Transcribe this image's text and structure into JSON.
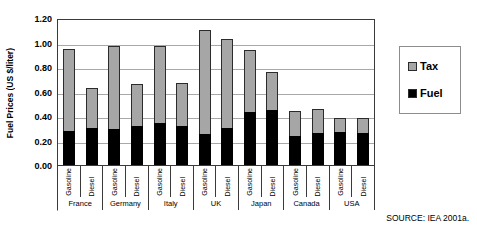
{
  "chart_data": {
    "type": "bar",
    "subtype": "stacked-vertical",
    "title": "",
    "xlabel": "",
    "ylabel": "Fuel Prices (US $/liter)",
    "ylim": [
      0.0,
      1.2
    ],
    "ytick_labels": [
      "1.20",
      "1.00",
      "0.80",
      "0.60",
      "0.40",
      "0.20",
      "0.00"
    ],
    "ytick_values": [
      1.2,
      1.0,
      0.8,
      0.6,
      0.4,
      0.2,
      0.0
    ],
    "grid": true,
    "grid_axis": "y",
    "legend_position": "right",
    "categories": [
      "France Gasoline",
      "France Diesel",
      "Germany Gasoline",
      "Germany Diesel",
      "Italy Gasoline",
      "Italy Diesel",
      "UK Gasoline",
      "UK Diesel",
      "Japan Gasoline",
      "Japan Diesel",
      "Canada Gasoline",
      "Canada Diesel",
      "USA Gasoline",
      "USA Diesel"
    ],
    "groups": [
      {
        "country": "France",
        "fuel_types": [
          "Gasoline",
          "Diesel"
        ]
      },
      {
        "country": "Germany",
        "fuel_types": [
          "Gasoline",
          "Diesel"
        ]
      },
      {
        "country": "Italy",
        "fuel_types": [
          "Gasoline",
          "Diesel"
        ]
      },
      {
        "country": "UK",
        "fuel_types": [
          "Gasoline",
          "Diesel"
        ]
      },
      {
        "country": "Japan",
        "fuel_types": [
          "Gasoline",
          "Diesel"
        ]
      },
      {
        "country": "Canada",
        "fuel_types": [
          "Gasoline",
          "Diesel"
        ]
      },
      {
        "country": "USA",
        "fuel_types": [
          "Gasoline",
          "Diesel"
        ]
      }
    ],
    "series": [
      {
        "name": "Fuel",
        "color": "#000000",
        "values": [
          0.28,
          0.3,
          0.29,
          0.32,
          0.34,
          0.32,
          0.25,
          0.3,
          0.43,
          0.45,
          0.24,
          0.26,
          0.27,
          0.26
        ]
      },
      {
        "name": "Tax",
        "color": "#A6A6A6",
        "values": [
          0.67,
          0.33,
          0.68,
          0.34,
          0.63,
          0.35,
          0.85,
          0.73,
          0.51,
          0.31,
          0.2,
          0.2,
          0.11,
          0.12
        ]
      }
    ],
    "totals": [
      0.95,
      0.63,
      0.97,
      0.66,
      0.97,
      0.67,
      1.1,
      1.03,
      0.94,
      0.76,
      0.44,
      0.46,
      0.38,
      0.38
    ]
  },
  "legend": {
    "items": [
      {
        "label": "Tax",
        "color": "#A6A6A6"
      },
      {
        "label": "Fuel",
        "color": "#000000"
      }
    ]
  },
  "source_note": "SOURCE: IEA 2001a."
}
